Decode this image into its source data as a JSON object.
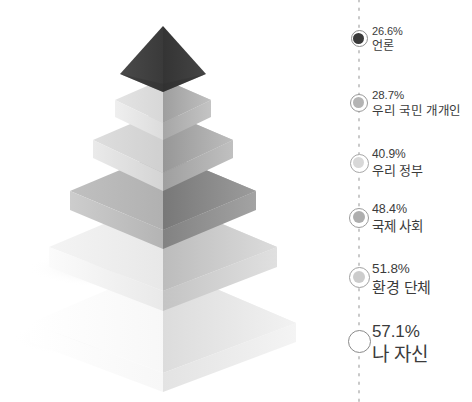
{
  "background_color": "#ffffff",
  "text_color": "#3b3b3b",
  "chart_data": {
    "type": "bar",
    "title": "",
    "subtitle": "",
    "xlabel": "",
    "ylabel": "",
    "grid": false,
    "legend_position": "right",
    "axis_style": "dotted-vertical",
    "shape": "3d-stacked-pyramid",
    "categories": [
      "언론",
      "우리 국민 개개인",
      "우리 정부",
      "국제 사회",
      "환경 단체",
      "나 자신"
    ],
    "values": [
      26.6,
      28.7,
      40.9,
      48.4,
      51.8,
      57.1
    ],
    "value_suffix": "%",
    "series": [
      {
        "name": "",
        "values": [
          26.6,
          28.7,
          40.9,
          48.4,
          51.8,
          57.1
        ]
      }
    ]
  },
  "pyramid": {
    "tiers": [
      {
        "index": 0,
        "name": "apex-tier",
        "value": "26.6",
        "label": "언론",
        "top_color": "#3e3e3e",
        "right_color": "#2f2f2f"
      },
      {
        "index": 1,
        "name": "tier-2",
        "value": "28.7",
        "label": "우리 국민 개개인",
        "top_color": "#d2d2d2",
        "right_color": "#a9a9a9"
      },
      {
        "index": 2,
        "name": "tier-3",
        "value": "40.9",
        "label": "우리 정부",
        "top_color": "#c9c9c9",
        "right_color": "#a3a3a3"
      },
      {
        "index": 3,
        "name": "tier-4",
        "value": "48.4",
        "label": "국제 사회",
        "top_color": "#aeaeae",
        "right_color": "#868686"
      },
      {
        "index": 4,
        "name": "tier-5",
        "value": "51.8",
        "label": "환경 단체",
        "top_color": "#e2e2e2",
        "right_color": "#c6c6c6"
      },
      {
        "index": 5,
        "name": "base-tier",
        "value": "57.1",
        "label": "나 자신",
        "top_color": "#fafafa",
        "right_color": "#e6e6e6"
      }
    ]
  },
  "legend": {
    "axis_color": "#c8c8c8",
    "items": [
      {
        "percent": "26.6%",
        "label": "언론",
        "marker_fill": "#3a3a3a",
        "marker_ring": "#8e8e8e",
        "marker_size": 17,
        "core_size": 11,
        "pct_size": 11,
        "label_size": 12,
        "y": 24
      },
      {
        "percent": "28.7%",
        "label": "우리 국민 개개인",
        "marker_fill": "#b4b4b4",
        "marker_ring": "#9a9a9a",
        "marker_size": 18,
        "core_size": 11,
        "pct_size": 11.5,
        "label_size": 12.5,
        "y": 88
      },
      {
        "percent": "40.9%",
        "label": "우리 정부",
        "marker_fill": "#d8d8d8",
        "marker_ring": "#a8a8a8",
        "marker_size": 19,
        "core_size": 11,
        "pct_size": 12,
        "label_size": 13,
        "y": 147
      },
      {
        "percent": "48.4%",
        "label": "국제 사회",
        "marker_fill": "#aeaeae",
        "marker_ring": "#9c9c9c",
        "marker_size": 20,
        "core_size": 12,
        "pct_size": 12.5,
        "label_size": 13.5,
        "y": 201
      },
      {
        "percent": "51.8%",
        "label": "환경 단체",
        "marker_fill": "#cccccc",
        "marker_ring": "#a0a0a0",
        "marker_size": 21,
        "core_size": 12,
        "pct_size": 13.5,
        "label_size": 15,
        "y": 260
      },
      {
        "percent": "57.1%",
        "label": "나 자신",
        "marker_fill": "#ffffff",
        "marker_ring": "#8a8a8a",
        "marker_size": 23,
        "core_size": 0,
        "pct_size": 17,
        "label_size": 19,
        "y": 321
      }
    ]
  }
}
